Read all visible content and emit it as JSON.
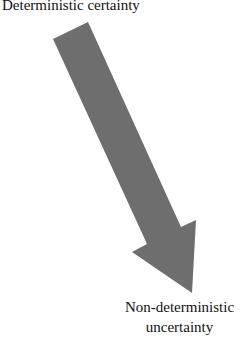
{
  "labels": {
    "start": "Deterministic certainty",
    "end_line1": "Non-deterministic",
    "end_line2": "uncertainty"
  },
  "arrow": {
    "color": "#6e6e6e",
    "direction": "down-right"
  }
}
